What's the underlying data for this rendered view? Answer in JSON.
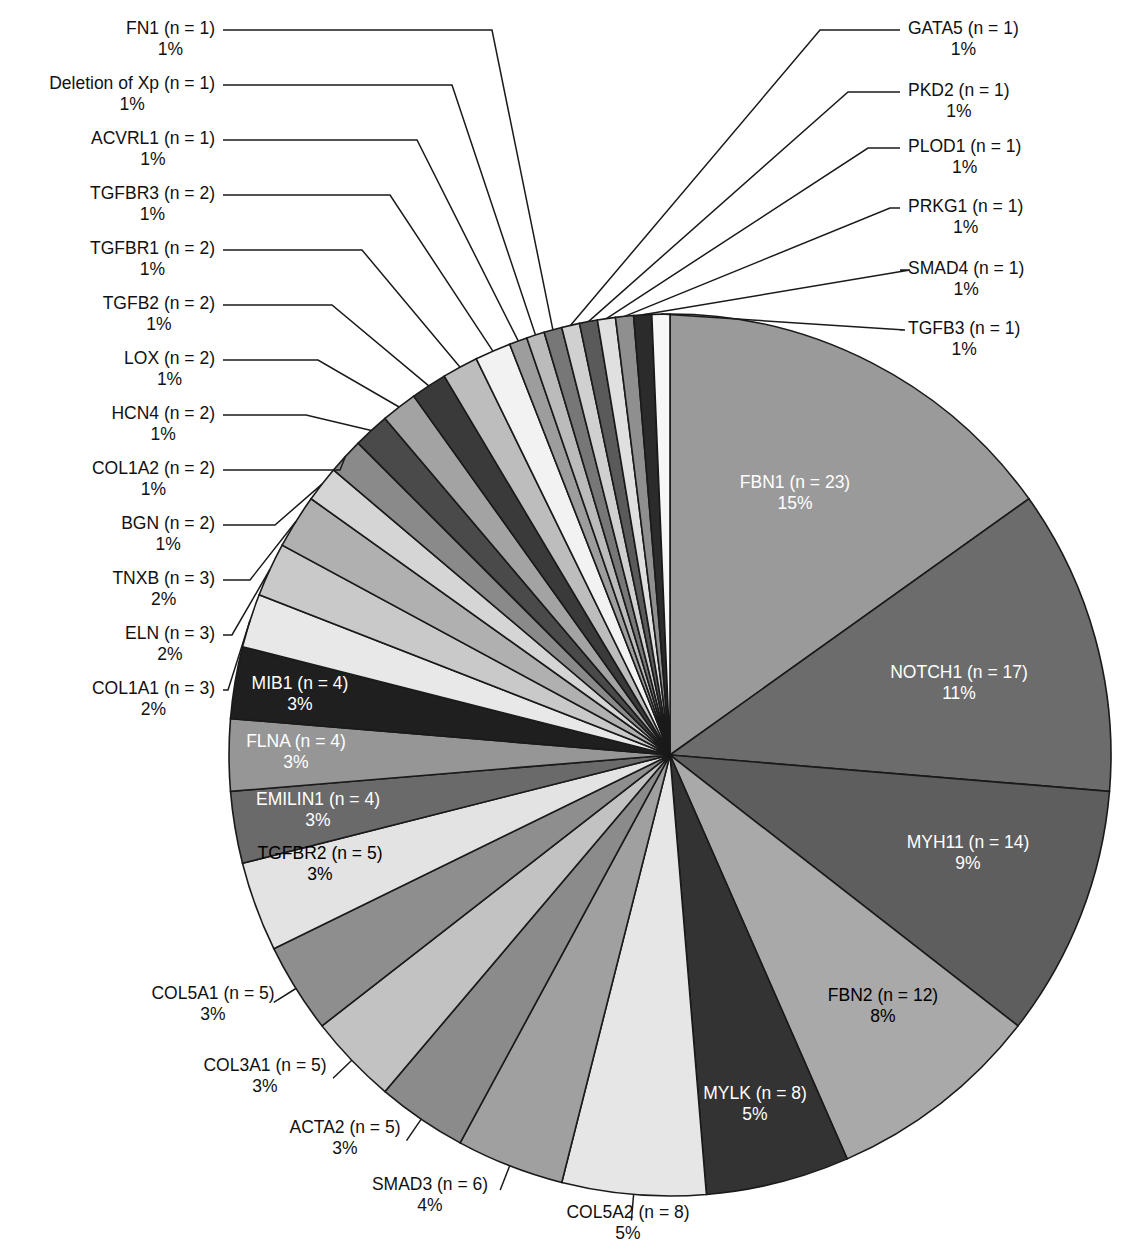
{
  "chart_data": {
    "type": "pie",
    "title": "",
    "subtitle": "",
    "xlabel": "",
    "ylabel": "",
    "legend_position": "none",
    "grid": false,
    "label_format": "{name} (n = {n})\n{percent}%",
    "total_n": 155,
    "start_angle_deg": 0,
    "direction": "clockwise",
    "categories": [
      "FBN1",
      "NOTCH1",
      "MYH11",
      "FBN2",
      "MYLK",
      "COL5A2",
      "SMAD3",
      "ACTA2",
      "COL3A1",
      "COL5A1",
      "TGFBR2",
      "EMILIN1",
      "FLNA",
      "MIB1",
      "COL1A1",
      "ELN",
      "TNXB",
      "BGN",
      "COL1A2",
      "HCN4",
      "LOX",
      "TGFB2",
      "TGFBR1",
      "TGFBR3",
      "ACVRL1",
      "Deletion of Xp",
      "FN1",
      "GATA5",
      "PKD2",
      "PLOD1",
      "PRKG1",
      "SMAD4",
      "TGFB3"
    ],
    "values": [
      23,
      17,
      14,
      12,
      8,
      8,
      6,
      5,
      5,
      5,
      5,
      4,
      4,
      4,
      3,
      3,
      3,
      2,
      2,
      2,
      2,
      2,
      2,
      2,
      1,
      1,
      1,
      1,
      1,
      1,
      1,
      1,
      1
    ],
    "percents": [
      15,
      11,
      9,
      8,
      5,
      5,
      4,
      3,
      3,
      3,
      3,
      3,
      3,
      3,
      2,
      2,
      2,
      1,
      1,
      1,
      1,
      1,
      1,
      1,
      1,
      1,
      1,
      1,
      1,
      1,
      1,
      1,
      1
    ],
    "slices": [
      {
        "name": "FBN1",
        "n": 23,
        "percent": 15,
        "label_line1": "FBN1 (n = 23)",
        "label_line2": "15%",
        "color": "#9a9a9a",
        "text_color": "#ffffff",
        "label_placement": "inside"
      },
      {
        "name": "NOTCH1",
        "n": 17,
        "percent": 11,
        "label_line1": "NOTCH1 (n = 17)",
        "label_line2": "11%",
        "color": "#6c6c6c",
        "text_color": "#ffffff",
        "label_placement": "inside"
      },
      {
        "name": "MYH11",
        "n": 14,
        "percent": 9,
        "label_line1": "MYH11 (n = 14)",
        "label_line2": "9%",
        "color": "#5e5e5e",
        "text_color": "#ffffff",
        "label_placement": "inside"
      },
      {
        "name": "FBN2",
        "n": 12,
        "percent": 8,
        "label_line1": "FBN2 (n = 12)",
        "label_line2": "8%",
        "color": "#a9a9a9",
        "text_color": "#000000",
        "label_placement": "inside"
      },
      {
        "name": "MYLK",
        "n": 8,
        "percent": 5,
        "label_line1": "MYLK (n = 8)",
        "label_line2": "5%",
        "color": "#333333",
        "text_color": "#ffffff",
        "label_placement": "inside"
      },
      {
        "name": "COL5A2",
        "n": 8,
        "percent": 5,
        "label_line1": "COL5A2 (n = 8)",
        "label_line2": "5%",
        "color": "#e6e6e6",
        "text_color": "#000000",
        "label_placement": "outside-bottom"
      },
      {
        "name": "SMAD3",
        "n": 6,
        "percent": 4,
        "label_line1": "SMAD3 (n = 6)",
        "label_line2": "4%",
        "color": "#a0a0a0",
        "text_color": "#000000",
        "label_placement": "outside-bottom"
      },
      {
        "name": "ACTA2",
        "n": 5,
        "percent": 3,
        "label_line1": "ACTA2 (n = 5)",
        "label_line2": "3%",
        "color": "#8b8b8b",
        "text_color": "#000000",
        "label_placement": "outside-bottom"
      },
      {
        "name": "COL3A1",
        "n": 5,
        "percent": 3,
        "label_line1": "COL3A1 (n = 5)",
        "label_line2": "3%",
        "color": "#c2c2c2",
        "text_color": "#000000",
        "label_placement": "outside-bottom"
      },
      {
        "name": "COL5A1",
        "n": 5,
        "percent": 3,
        "label_line1": "COL5A1 (n = 5)",
        "label_line2": "3%",
        "color": "#8e8e8e",
        "text_color": "#000000",
        "label_placement": "outside-left"
      },
      {
        "name": "TGFBR2",
        "n": 5,
        "percent": 3,
        "label_line1": "TGFBR2 (n = 5)",
        "label_line2": "3%",
        "color": "#e3e3e3",
        "text_color": "#000000",
        "label_placement": "inside"
      },
      {
        "name": "EMILIN1",
        "n": 4,
        "percent": 3,
        "label_line1": "EMILIN1 (n = 4)",
        "label_line2": "3%",
        "color": "#6a6a6a",
        "text_color": "#ffffff",
        "label_placement": "inside"
      },
      {
        "name": "FLNA",
        "n": 4,
        "percent": 3,
        "label_line1": "FLNA (n = 4)",
        "label_line2": "3%",
        "color": "#969696",
        "text_color": "#ffffff",
        "label_placement": "inside"
      },
      {
        "name": "MIB1",
        "n": 4,
        "percent": 3,
        "label_line1": "MIB1 (n = 4)",
        "label_line2": "3%",
        "color": "#1f1f1f",
        "text_color": "#ffffff",
        "label_placement": "inside"
      },
      {
        "name": "COL1A1",
        "n": 3,
        "percent": 2,
        "label_line1": "COL1A1 (n = 3)",
        "label_line2": "2%",
        "color": "#e8e8e8",
        "text_color": "#000000",
        "label_placement": "outside-left"
      },
      {
        "name": "ELN",
        "n": 3,
        "percent": 2,
        "label_line1": "ELN (n = 3)",
        "label_line2": "2%",
        "color": "#c9c9c9",
        "text_color": "#000000",
        "label_placement": "outside-left"
      },
      {
        "name": "TNXB",
        "n": 3,
        "percent": 2,
        "label_line1": "TNXB (n = 3)",
        "label_line2": "2%",
        "color": "#b0b0b0",
        "text_color": "#000000",
        "label_placement": "outside-left"
      },
      {
        "name": "BGN",
        "n": 2,
        "percent": 1,
        "label_line1": "BGN (n = 2)",
        "label_line2": "1%",
        "color": "#d5d5d5",
        "text_color": "#000000",
        "label_placement": "outside-left"
      },
      {
        "name": "COL1A2",
        "n": 2,
        "percent": 1,
        "label_line1": "COL1A2 (n = 2)",
        "label_line2": "1%",
        "color": "#8a8a8a",
        "text_color": "#000000",
        "label_placement": "outside-left"
      },
      {
        "name": "HCN4",
        "n": 2,
        "percent": 1,
        "label_line1": "HCN4 (n = 2)",
        "label_line2": "1%",
        "color": "#4a4a4a",
        "text_color": "#ffffff",
        "label_placement": "outside-left"
      },
      {
        "name": "LOX",
        "n": 2,
        "percent": 1,
        "label_line1": "LOX (n = 2)",
        "label_line2": "1%",
        "color": "#a3a3a3",
        "text_color": "#000000",
        "label_placement": "outside-left"
      },
      {
        "name": "TGFB2",
        "n": 2,
        "percent": 1,
        "label_line1": "TGFB2 (n = 2)",
        "label_line2": "1%",
        "color": "#3a3a3a",
        "text_color": "#ffffff",
        "label_placement": "outside-left"
      },
      {
        "name": "TGFBR1",
        "n": 2,
        "percent": 1,
        "label_line1": "TGFBR1 (n = 2)",
        "label_line2": "1%",
        "color": "#bdbdbd",
        "text_color": "#000000",
        "label_placement": "outside-left"
      },
      {
        "name": "TGFBR3",
        "n": 2,
        "percent": 1,
        "label_line1": "TGFBR3 (n = 2)",
        "label_line2": "1%",
        "color": "#f2f2f2",
        "text_color": "#000000",
        "label_placement": "outside-left"
      },
      {
        "name": "ACVRL1",
        "n": 1,
        "percent": 1,
        "label_line1": "ACVRL1 (n = 1)",
        "label_line2": "1%",
        "color": "#9d9d9d",
        "text_color": "#000000",
        "label_placement": "outside-left"
      },
      {
        "name": "Deletion of Xp",
        "n": 1,
        "percent": 1,
        "label_line1": "Deletion of Xp (n = 1)",
        "label_line2": "1%",
        "color": "#bbbbbb",
        "text_color": "#000000",
        "label_placement": "outside-left"
      },
      {
        "name": "FN1",
        "n": 1,
        "percent": 1,
        "label_line1": "FN1 (n = 1)",
        "label_line2": "1%",
        "color": "#777777",
        "text_color": "#ffffff",
        "label_placement": "outside-left"
      },
      {
        "name": "GATA5",
        "n": 1,
        "percent": 1,
        "label_line1": "GATA5 (n = 1)",
        "label_line2": "1%",
        "color": "#d0d0d0",
        "text_color": "#000000",
        "label_placement": "outside-right"
      },
      {
        "name": "PKD2",
        "n": 1,
        "percent": 1,
        "label_line1": "PKD2 (n = 1)",
        "label_line2": "1%",
        "color": "#5a5a5a",
        "text_color": "#ffffff",
        "label_placement": "outside-right"
      },
      {
        "name": "PLOD1",
        "n": 1,
        "percent": 1,
        "label_line1": "PLOD1 (n = 1)",
        "label_line2": "1%",
        "color": "#e0e0e0",
        "text_color": "#000000",
        "label_placement": "outside-right"
      },
      {
        "name": "PRKG1",
        "n": 1,
        "percent": 1,
        "label_line1": "PRKG1 (n = 1)",
        "label_line2": "1%",
        "color": "#8f8f8f",
        "text_color": "#000000",
        "label_placement": "outside-right"
      },
      {
        "name": "SMAD4",
        "n": 1,
        "percent": 1,
        "label_line1": "SMAD4 (n = 1)",
        "label_line2": "1%",
        "color": "#2b2b2b",
        "text_color": "#ffffff",
        "label_placement": "outside-right"
      },
      {
        "name": "TGFB3",
        "n": 1,
        "percent": 1,
        "label_line1": "TGFB3 (n = 1)",
        "label_line2": "1%",
        "color": "#f7f7f7",
        "text_color": "#000000",
        "label_placement": "outside-right"
      }
    ]
  },
  "geometry": {
    "center_x": 670,
    "center_y": 755,
    "radius": 441
  },
  "outer_labels_left": [
    {
      "key": "FN1",
      "line1": "FN1 (n = 1)",
      "line2": "1%",
      "text_right": 215,
      "text_top": 18,
      "elbow_x": 492,
      "elbow_y": 30
    },
    {
      "key": "Deletion of Xp",
      "line1": "Deletion of Xp (n = 1)",
      "line2": "1%",
      "text_right": 215,
      "text_top": 73,
      "elbow_x": 452,
      "elbow_y": 85
    },
    {
      "key": "ACVRL1",
      "line1": "ACVRL1 (n = 1)",
      "line2": "1%",
      "text_right": 215,
      "text_top": 128,
      "elbow_x": 417,
      "elbow_y": 140
    },
    {
      "key": "TGFBR3",
      "line1": "TGFBR3 (n = 2)",
      "line2": "1%",
      "text_right": 215,
      "text_top": 183,
      "elbow_x": 390,
      "elbow_y": 195
    },
    {
      "key": "TGFBR1",
      "line1": "TGFBR1 (n = 2)",
      "line2": "1%",
      "text_right": 215,
      "text_top": 238,
      "elbow_x": 362,
      "elbow_y": 250
    },
    {
      "key": "TGFB2",
      "line1": "TGFB2 (n = 2)",
      "line2": "1%",
      "text_right": 215,
      "text_top": 293,
      "elbow_x": 332,
      "elbow_y": 305
    },
    {
      "key": "LOX",
      "line1": "LOX (n = 2)",
      "line2": "1%",
      "text_right": 215,
      "text_top": 348,
      "elbow_x": 318,
      "elbow_y": 360
    },
    {
      "key": "HCN4",
      "line1": "HCN4 (n = 2)",
      "line2": "1%",
      "text_right": 215,
      "text_top": 403,
      "elbow_x": 306,
      "elbow_y": 415
    },
    {
      "key": "COL1A2",
      "line1": "COL1A2 (n = 2)",
      "line2": "1%",
      "text_right": 215,
      "text_top": 458,
      "elbow_x": 340,
      "elbow_y": 470
    },
    {
      "key": "BGN",
      "line1": "BGN (n = 2)",
      "line2": "1%",
      "text_right": 215,
      "text_top": 513,
      "elbow_x": 275,
      "elbow_y": 525
    },
    {
      "key": "TNXB",
      "line1": "TNXB (n = 3)",
      "line2": "2%",
      "text_right": 215,
      "text_top": 568,
      "elbow_x": 250,
      "elbow_y": 580
    },
    {
      "key": "ELN",
      "line1": "ELN (n = 3)",
      "line2": "2%",
      "text_right": 215,
      "text_top": 623,
      "elbow_x": 232,
      "elbow_y": 635
    },
    {
      "key": "COL1A1",
      "line1": "COL1A1 (n = 3)",
      "line2": "2%",
      "text_right": 215,
      "text_top": 678,
      "elbow_x": 228,
      "elbow_y": 690
    }
  ],
  "outer_labels_right": [
    {
      "key": "GATA5",
      "line1": "GATA5 (n = 1)",
      "line2": "1%",
      "text_left": 908,
      "text_top": 18,
      "elbow_x": 820,
      "elbow_y": 30
    },
    {
      "key": "PKD2",
      "line1": "PKD2 (n = 1)",
      "line2": "1%",
      "text_left": 908,
      "text_top": 80,
      "elbow_x": 848,
      "elbow_y": 92
    },
    {
      "key": "PLOD1",
      "line1": "PLOD1 (n = 1)",
      "line2": "1%",
      "text_left": 908,
      "text_top": 136,
      "elbow_x": 868,
      "elbow_y": 148
    },
    {
      "key": "PRKG1",
      "line1": "PRKG1 (n = 1)",
      "line2": "1%",
      "text_left": 908,
      "text_top": 196,
      "elbow_x": 890,
      "elbow_y": 208
    },
    {
      "key": "SMAD4",
      "line1": "SMAD4 (n = 1)",
      "line2": "1%",
      "text_left": 908,
      "text_top": 258,
      "elbow_x": 910,
      "elbow_y": 270
    },
    {
      "key": "TGFB3",
      "line1": "TGFB3 (n = 1)",
      "line2": "1%",
      "text_left": 908,
      "text_top": 318,
      "elbow_x": 905,
      "elbow_y": 330
    }
  ],
  "outer_labels_bottom": [
    {
      "key": "COL5A1",
      "line1": "COL5A1 (n = 5)",
      "line2": "3%",
      "center_x": 213,
      "text_top": 983,
      "tick_x": 297,
      "tick_y": 982
    },
    {
      "key": "COL3A1",
      "line1": "COL3A1 (n = 5)",
      "line2": "3%",
      "center_x": 265,
      "text_top": 1055,
      "tick_x": 350,
      "tick_y": 1050
    },
    {
      "key": "ACTA2",
      "line1": "ACTA2 (n = 5)",
      "line2": "3%",
      "center_x": 345,
      "text_top": 1117,
      "tick_x": 427,
      "tick_y": 1112
    },
    {
      "key": "SMAD3",
      "line1": "SMAD3 (n = 6)",
      "line2": "4%",
      "center_x": 430,
      "text_top": 1174,
      "tick_x": 513,
      "tick_y": 1167
    },
    {
      "key": "COL5A2",
      "line1": "COL5A2 (n = 8)",
      "line2": "5%",
      "center_x": 628,
      "text_top": 1202,
      "tick_x": 628,
      "tick_y": 1190
    }
  ],
  "inner_labels": [
    {
      "key": "FBN1",
      "line1": "FBN1 (n = 23)",
      "line2": "15%",
      "x": 795,
      "y": 493,
      "color": "#ffffff"
    },
    {
      "key": "NOTCH1",
      "line1": "NOTCH1 (n = 17)",
      "line2": "11%",
      "x": 959,
      "y": 683,
      "color": "#ffffff"
    },
    {
      "key": "MYH11",
      "line1": "MYH11 (n = 14)",
      "line2": "9%",
      "x": 968,
      "y": 853,
      "color": "#ffffff"
    },
    {
      "key": "FBN2",
      "line1": "FBN2 (n = 12)",
      "line2": "8%",
      "x": 883,
      "y": 1006,
      "color": "#000000"
    },
    {
      "key": "MYLK",
      "line1": "MYLK (n = 8)",
      "line2": "5%",
      "x": 755,
      "y": 1104,
      "color": "#ffffff"
    },
    {
      "key": "MIB1",
      "line1": "MIB1 (n = 4)",
      "line2": "3%",
      "x": 300,
      "y": 694,
      "color": "#ffffff"
    },
    {
      "key": "FLNA",
      "line1": "FLNA (n = 4)",
      "line2": "3%",
      "x": 296,
      "y": 752,
      "color": "#ffffff"
    },
    {
      "key": "EMILIN1",
      "line1": "EMILIN1 (n = 4)",
      "line2": "3%",
      "x": 318,
      "y": 810,
      "color": "#ffffff"
    },
    {
      "key": "TGFBR2",
      "line1": "TGFBR2 (n = 5)",
      "line2": "3%",
      "x": 320,
      "y": 864,
      "color": "#000000"
    }
  ]
}
